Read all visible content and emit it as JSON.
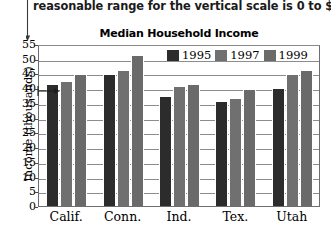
{
  "instruction": {
    "text": "reasonable range for the vertical scale is 0 to $55,000."
  },
  "annotations": {
    "leader_line_icon": "down-arrow-leader",
    "value_arrow_icon": "right-arrow-pointer",
    "value_arrow_target": "40"
  },
  "chart_data": {
    "type": "bar",
    "title": "Median Household Income",
    "xlabel": "",
    "ylabel": "Income (thousands)",
    "ylim": [
      0,
      55
    ],
    "ytick_step": 5,
    "yticks": [
      "0",
      "5",
      "10",
      "15",
      "20",
      "25",
      "30",
      "35",
      "40",
      "45",
      "50",
      "55"
    ],
    "grid": true,
    "legend_position": "top-right-inside",
    "categories": [
      "Calif.",
      "Conn.",
      "Ind.",
      "Tex.",
      "Utah"
    ],
    "series": [
      {
        "name": "1995",
        "color": "#2c2c2c",
        "values": [
          41.0,
          44.5,
          37.0,
          35.3,
          39.8
        ]
      },
      {
        "name": "1997",
        "color": "#707070",
        "values": [
          42.0,
          46.0,
          40.5,
          36.5,
          44.5
        ]
      },
      {
        "name": "1999",
        "color": "#6a6a6a",
        "values": [
          44.5,
          51.0,
          41.0,
          39.3,
          46.0
        ]
      }
    ]
  }
}
